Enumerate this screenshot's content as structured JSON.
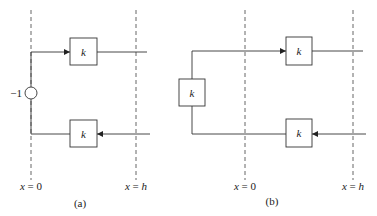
{
  "diagram": {
    "type": "block-diagram",
    "panels": [
      {
        "id": "a",
        "caption": "(a)",
        "boundaries": [
          {
            "label": "x = 0",
            "var": "x",
            "eq": " = ",
            "val": "0"
          },
          {
            "label": "x = h",
            "var": "x",
            "eq": " = ",
            "val": "h"
          }
        ],
        "blocks": [
          {
            "label": "k",
            "role": "forward-gain"
          },
          {
            "label": "k",
            "role": "backward-gain"
          }
        ],
        "junction": {
          "label": "−1",
          "shape": "circle"
        }
      },
      {
        "id": "b",
        "caption": "(b)",
        "boundaries": [
          {
            "label": "x = 0",
            "var": "x",
            "eq": " = ",
            "val": "0"
          },
          {
            "label": "x = h",
            "var": "x",
            "eq": " = ",
            "val": "h"
          }
        ],
        "blocks": [
          {
            "label": "k",
            "role": "reflection-gain"
          },
          {
            "label": "k",
            "role": "forward-gain"
          },
          {
            "label": "k",
            "role": "backward-gain"
          }
        ]
      }
    ],
    "colors": {
      "stroke": "#333333",
      "dash": "#555555",
      "background": "#ffffff"
    }
  }
}
